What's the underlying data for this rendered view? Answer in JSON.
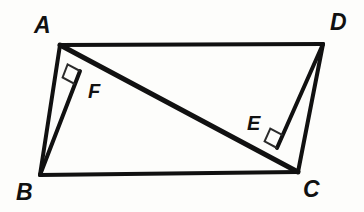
{
  "figure": {
    "background_color": "#fdfdfb",
    "stroke_color": "#111111",
    "label_color": "#111111",
    "canvas": {
      "width": 364,
      "height": 212
    }
  },
  "labels": {
    "a": "A",
    "b": "B",
    "c": "C",
    "d": "D",
    "e": "E",
    "f": "F"
  },
  "geometry": {
    "points": {
      "A": {
        "x": 60,
        "y": 45
      },
      "B": {
        "x": 40,
        "y": 175
      },
      "C": {
        "x": 298,
        "y": 172
      },
      "D": {
        "x": 323,
        "y": 44
      },
      "E": {
        "x": 277,
        "y": 148
      },
      "F": {
        "x": 80,
        "y": 71
      }
    },
    "label_positions": {
      "A": {
        "x": 34,
        "y": 14
      },
      "B": {
        "x": 16,
        "y": 181
      },
      "C": {
        "x": 303,
        "y": 178
      },
      "D": {
        "x": 330,
        "y": 11
      },
      "E": {
        "x": 247,
        "y": 113
      },
      "F": {
        "x": 88,
        "y": 81
      }
    },
    "segments": [
      {
        "name": "side-AD",
        "from": "A",
        "to": "D",
        "width": 4
      },
      {
        "name": "side-AB",
        "from": "A",
        "to": "B",
        "width": 4
      },
      {
        "name": "side-BC",
        "from": "B",
        "to": "C",
        "width": 4
      },
      {
        "name": "side-DC",
        "from": "D",
        "to": "C",
        "width": 4
      },
      {
        "name": "diagonal-AC",
        "from": "A",
        "to": "C",
        "width": 5
      },
      {
        "name": "perpendicular-BF",
        "from": "B",
        "to": "F",
        "width": 4
      },
      {
        "name": "perpendicular-DE",
        "from": "D",
        "to": "E",
        "width": 4
      }
    ],
    "right_angles": [
      {
        "name": "right-angle-at-F",
        "vertex": "F",
        "size": 14,
        "width": 2
      },
      {
        "name": "right-angle-at-E",
        "vertex": "E",
        "size": 14,
        "width": 2
      }
    ]
  }
}
